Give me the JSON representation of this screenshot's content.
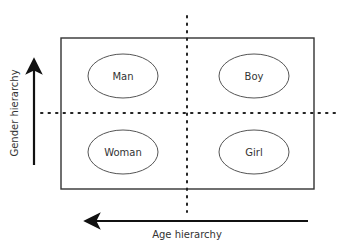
{
  "diagram": {
    "quadrants": [
      {
        "label": "Man",
        "position": "top-left"
      },
      {
        "label": "Boy",
        "position": "top-right"
      },
      {
        "label": "Woman",
        "position": "bottom-left"
      },
      {
        "label": "Girl",
        "position": "bottom-right"
      }
    ],
    "axes": {
      "vertical": {
        "label": "Gender hierarchy",
        "direction": "up"
      },
      "horizontal": {
        "label": "Age hierarchy",
        "direction": "left"
      }
    },
    "colors": {
      "stroke": "#333333",
      "text": "#333333",
      "background": "#ffffff"
    }
  }
}
